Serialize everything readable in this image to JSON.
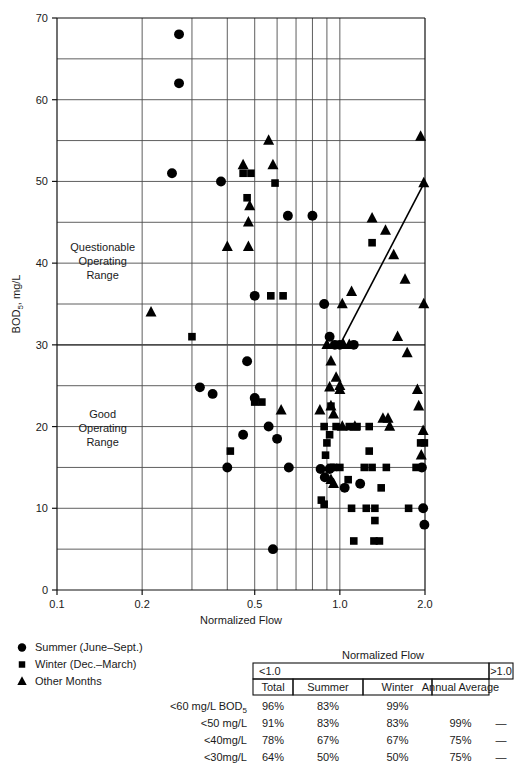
{
  "chart_data": {
    "type": "scatter",
    "title": "",
    "xlabel": "Normalized Flow",
    "ylabel": "BOD5, mg/L",
    "ylabel_base": "BOD",
    "ylabel_sub": "5",
    "ylabel_rest": ", mg/L",
    "xscale": "log",
    "xlim": [
      0.1,
      2.0
    ],
    "ylim": [
      0,
      70
    ],
    "grid": true,
    "x_ticks_labeled": [
      0.1,
      0.2,
      0.5,
      1.0,
      2.0
    ],
    "x_tick_labels": [
      "0.1",
      "0.2",
      "0.5",
      "1.0",
      "2.0"
    ],
    "x_gridlines": [
      0.1,
      0.2,
      0.3,
      0.4,
      0.5,
      0.6,
      0.7,
      0.8,
      0.9,
      1.0,
      2.0
    ],
    "y_ticks_labeled": [
      0,
      10,
      20,
      30,
      40,
      50,
      60,
      70
    ],
    "y_tick_labels": [
      "0",
      "10",
      "20",
      "30",
      "40",
      "50",
      "60",
      "70"
    ],
    "y_gridlines": [
      0,
      5,
      10,
      15,
      20,
      25,
      30,
      35,
      40,
      45,
      50,
      55,
      60,
      65,
      70
    ],
    "emphasis_gridline_y": 30,
    "annotations": [
      {
        "text_lines": [
          "Questionable",
          "Operating",
          "Range"
        ],
        "x": 0.145,
        "y": 41.5
      },
      {
        "text_lines": [
          "Good",
          "Operating",
          "Range"
        ],
        "x": 0.145,
        "y": 21.0
      }
    ],
    "trend_line": {
      "x1": 1.0,
      "y1": 30,
      "x2": 2.0,
      "y2": 50
    },
    "series": [
      {
        "name": "Summer (June–Sept.)",
        "marker": "circle",
        "points": [
          [
            0.27,
            68.0
          ],
          [
            0.27,
            62.0
          ],
          [
            0.255,
            51.0
          ],
          [
            0.38,
            50.0
          ],
          [
            0.5,
            36.0
          ],
          [
            0.655,
            45.8
          ],
          [
            0.8,
            45.8
          ],
          [
            0.88,
            35.0
          ],
          [
            0.32,
            24.8
          ],
          [
            0.355,
            24.0
          ],
          [
            0.5,
            23.5
          ],
          [
            0.56,
            20.0
          ],
          [
            0.47,
            28.0
          ],
          [
            0.6,
            18.5
          ],
          [
            0.455,
            19.0
          ],
          [
            0.66,
            15.0
          ],
          [
            0.4,
            15.0
          ],
          [
            0.92,
            31.0
          ],
          [
            0.96,
            30.0
          ],
          [
            1.0,
            30.0
          ],
          [
            0.885,
            13.8
          ],
          [
            1.12,
            30.0
          ],
          [
            1.18,
            13.0
          ],
          [
            1.95,
            15.0
          ],
          [
            1.97,
            10.0
          ],
          [
            1.99,
            8.0
          ],
          [
            0.58,
            5.0
          ],
          [
            0.855,
            14.8
          ],
          [
            0.92,
            14.8
          ],
          [
            1.04,
            12.5
          ]
        ]
      },
      {
        "name": "Winter (Dec.–March)",
        "marker": "square",
        "points": [
          [
            0.455,
            51.0
          ],
          [
            0.485,
            51.0
          ],
          [
            0.47,
            48.0
          ],
          [
            0.59,
            49.8
          ],
          [
            0.3,
            31.0
          ],
          [
            0.57,
            36.0
          ],
          [
            0.63,
            36.0
          ],
          [
            0.5,
            23.0
          ],
          [
            0.53,
            23.0
          ],
          [
            0.41,
            17.0
          ],
          [
            0.88,
            20.0
          ],
          [
            0.97,
            20.0
          ],
          [
            1.27,
            20.0
          ],
          [
            0.9,
            18.0
          ],
          [
            0.89,
            16.5
          ],
          [
            0.86,
            11.0
          ],
          [
            0.88,
            10.5
          ],
          [
            0.93,
            15.0
          ],
          [
            1.0,
            15.0
          ],
          [
            1.22,
            15.0
          ],
          [
            1.3,
            15.0
          ],
          [
            1.46,
            15.0
          ],
          [
            1.27,
            17.0
          ],
          [
            1.07,
            13.5
          ],
          [
            1.4,
            12.5
          ],
          [
            1.1,
            10.0
          ],
          [
            1.24,
            10.0
          ],
          [
            1.33,
            10.0
          ],
          [
            1.33,
            8.5
          ],
          [
            1.12,
            6.0
          ],
          [
            1.32,
            6.0
          ],
          [
            1.38,
            6.0
          ],
          [
            1.75,
            10.0
          ],
          [
            1.93,
            18.0
          ],
          [
            1.99,
            18.0
          ],
          [
            1.86,
            15.0
          ],
          [
            1.3,
            42.5
          ],
          [
            0.93,
            22.5
          ],
          [
            0.95,
            15.0
          ],
          [
            1.15,
            20.0
          ],
          [
            0.92,
            19.0
          ],
          [
            1.08,
            20.0
          ]
        ]
      },
      {
        "name": "Other Months",
        "marker": "triangle",
        "points": [
          [
            0.56,
            55.0
          ],
          [
            0.455,
            52.0
          ],
          [
            0.58,
            52.0
          ],
          [
            0.48,
            47.0
          ],
          [
            0.475,
            45.0
          ],
          [
            0.4,
            42.0
          ],
          [
            0.475,
            42.0
          ],
          [
            0.215,
            34.0
          ],
          [
            1.3,
            45.5
          ],
          [
            1.45,
            44.0
          ],
          [
            1.55,
            41.0
          ],
          [
            1.7,
            38.0
          ],
          [
            1.93,
            55.5
          ],
          [
            1.98,
            49.8
          ],
          [
            1.6,
            31.0
          ],
          [
            1.73,
            29.0
          ],
          [
            1.88,
            24.5
          ],
          [
            1.9,
            22.5
          ],
          [
            1.97,
            19.5
          ],
          [
            1.94,
            16.5
          ],
          [
            1.98,
            35.0
          ],
          [
            0.92,
            24.8
          ],
          [
            0.85,
            22.0
          ],
          [
            0.95,
            21.5
          ],
          [
            0.93,
            22.5
          ],
          [
            1.0,
            25.0
          ],
          [
            1.02,
            20.0
          ],
          [
            1.13,
            20.0
          ],
          [
            1.42,
            21.0
          ],
          [
            1.48,
            21.0
          ],
          [
            0.9,
            30.0
          ],
          [
            0.93,
            28.0
          ],
          [
            0.97,
            26.0
          ],
          [
            1.0,
            24.5
          ],
          [
            1.03,
            30.0
          ],
          [
            1.08,
            30.0
          ],
          [
            0.93,
            13.5
          ],
          [
            0.95,
            13.0
          ],
          [
            0.62,
            22.0
          ],
          [
            1.5,
            20.0
          ],
          [
            1.02,
            35.0
          ],
          [
            1.1,
            36.5
          ]
        ]
      }
    ]
  },
  "legend": {
    "items": [
      {
        "marker": "circle",
        "label": "Summer (June–Sept.)"
      },
      {
        "marker": "square",
        "label": "Winter (Dec.–March)"
      },
      {
        "marker": "triangle",
        "label": "Other Months"
      }
    ]
  },
  "table": {
    "super_header": "Normalized Flow",
    "group_headers": [
      {
        "label": "<1.0",
        "span": 4
      },
      {
        "label": ">1.0",
        "span": 1
      }
    ],
    "column_headers": [
      "Total",
      "Summer",
      "Winter",
      "Annual Average"
    ],
    "rows": [
      {
        "label_main": "<60 mg/L BOD",
        "label_sub": "5",
        "values": [
          "96%",
          "83%",
          "99%",
          "",
          ""
        ]
      },
      {
        "label_main": "<50 mg/L",
        "label_sub": "",
        "values": [
          "91%",
          "83%",
          "83%",
          "99%",
          "—"
        ]
      },
      {
        "label_main": "<40mg/L",
        "label_sub": "",
        "values": [
          "78%",
          "67%",
          "67%",
          "75%",
          "—"
        ]
      },
      {
        "label_main": "<30mg/L",
        "label_sub": "",
        "values": [
          "64%",
          "50%",
          "50%",
          "75%",
          "—"
        ]
      }
    ]
  },
  "colors": {
    "ink": "#1a1a1a",
    "grid": "#4d4d4d",
    "axis": "#111111",
    "marker": "#000000",
    "background": "#ffffff"
  }
}
